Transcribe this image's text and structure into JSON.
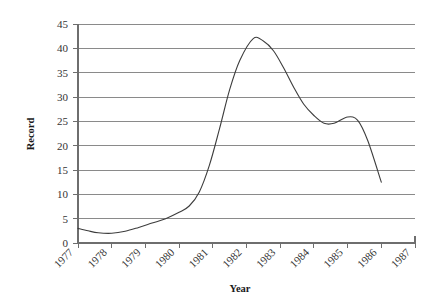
{
  "chart_data": {
    "type": "line",
    "title": "",
    "xlabel": "Year",
    "ylabel": "Record",
    "xlim": [
      1977,
      1987
    ],
    "ylim": [
      0,
      45
    ],
    "ytick_step": 5,
    "grid": "horizontal",
    "legend": "none",
    "line_color": "#3d3d3d",
    "grid_color": "#8a8a8a",
    "axis_color": "#6e6e6e",
    "background": "#ffffff",
    "xticks": [
      "1977",
      "1978",
      "1979",
      "1980",
      "1981",
      "1982",
      "1983",
      "1984",
      "1985",
      "1986",
      "1987"
    ],
    "yticks": [
      "0",
      "5",
      "10",
      "15",
      "20",
      "25",
      "30",
      "35",
      "40",
      "45"
    ],
    "x": [
      1977.0,
      1977.3,
      1977.6,
      1978.0,
      1978.4,
      1978.8,
      1979.2,
      1979.6,
      1980.0,
      1980.3,
      1980.6,
      1980.9,
      1981.2,
      1981.5,
      1981.8,
      1982.2,
      1982.5,
      1982.8,
      1983.1,
      1983.4,
      1983.7,
      1984.0,
      1984.3,
      1984.6,
      1985.0,
      1985.3,
      1985.6,
      1986.0
    ],
    "y": [
      3.0,
      2.5,
      2.1,
      2.0,
      2.4,
      3.2,
      4.1,
      5.0,
      6.3,
      7.6,
      10.5,
      16.0,
      23.5,
      31.5,
      37.5,
      42.0,
      41.5,
      39.5,
      36.0,
      32.0,
      28.5,
      26.2,
      24.6,
      24.6,
      25.9,
      25.2,
      21.0,
      12.5
    ],
    "series": [
      {
        "name": "Record",
        "values": [
          3.0,
          2.5,
          2.1,
          2.0,
          2.4,
          3.2,
          4.1,
          5.0,
          6.3,
          7.6,
          10.5,
          16.0,
          23.5,
          31.5,
          37.5,
          42.0,
          41.5,
          39.5,
          36.0,
          32.0,
          28.5,
          26.2,
          24.6,
          24.6,
          25.9,
          25.2,
          21.0,
          12.5
        ]
      }
    ],
    "annotations": {
      "start_value": "3",
      "minimum_value": "2",
      "minimum_year": "1978",
      "peak_value": "42",
      "peak_year": "1982",
      "end_value": "12.5",
      "end_year": "1986"
    }
  }
}
